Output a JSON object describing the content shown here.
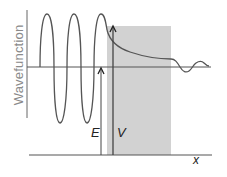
{
  "diagram": {
    "y_axis_label": "Wavefunction",
    "x_axis_label": "x",
    "energy_label": "E",
    "barrier_label": "V",
    "colors": {
      "curve": "#555555",
      "axis": "#555555",
      "barrier_fill": "#d0d0d0",
      "label_gray": "#8a8a8a",
      "label_dark": "#222222"
    },
    "regions": [
      {
        "name": "incident",
        "description": "oscillating wave left of barrier"
      },
      {
        "name": "barrier",
        "description": "exponentially decaying wave inside shaded barrier"
      },
      {
        "name": "transmitted",
        "description": "small-amplitude oscillating wave right of barrier"
      }
    ]
  }
}
